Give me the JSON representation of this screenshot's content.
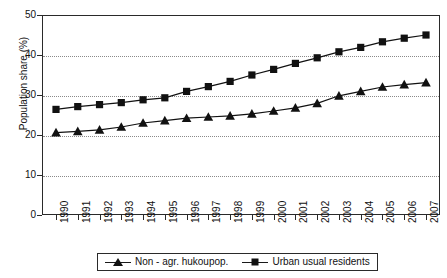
{
  "chart_data": {
    "type": "line",
    "title": "",
    "xlabel": "",
    "ylabel": "Population share (%)",
    "ylim": [
      0,
      50
    ],
    "yticks": [
      0,
      10,
      20,
      30,
      40,
      50
    ],
    "grid": "horizontal-dotted",
    "legend_position": "bottom",
    "categories": [
      "1990",
      "1991",
      "1992",
      "1993",
      "1994",
      "1995",
      "1996",
      "1997",
      "1998",
      "1999",
      "2000",
      "2001",
      "2002",
      "2003",
      "2004",
      "2005",
      "2006",
      "2007"
    ],
    "series": [
      {
        "name": "Non - agr. hukoupop.",
        "marker": "triangle",
        "color": "#111111",
        "values": [
          20.6,
          20.9,
          21.3,
          22.0,
          23.0,
          23.6,
          24.2,
          24.5,
          24.8,
          25.3,
          26.0,
          26.8,
          27.9,
          29.8,
          30.9,
          32.0,
          32.6,
          33.1
        ]
      },
      {
        "name": "Urban usual residents",
        "marker": "square",
        "color": "#111111",
        "values": [
          26.4,
          27.1,
          27.6,
          28.1,
          28.8,
          29.3,
          30.9,
          32.1,
          33.4,
          35.0,
          36.4,
          37.9,
          39.3,
          40.8,
          41.9,
          43.3,
          44.2,
          45.0
        ]
      }
    ]
  },
  "axes": {
    "y_title": "Population share (%)",
    "y_tick_labels": [
      "0",
      "10",
      "20",
      "30",
      "40",
      "50"
    ],
    "x_tick_labels": [
      "1990",
      "1991",
      "1992",
      "1993",
      "1994",
      "1995",
      "1996",
      "1997",
      "1998",
      "1999",
      "2000",
      "2001",
      "2002",
      "2003",
      "2004",
      "2005",
      "2006",
      "2007"
    ]
  },
  "legend": {
    "entries": [
      {
        "label": "Non - agr. hukoupop.",
        "marker": "triangle-marker"
      },
      {
        "label": "Urban usual residents",
        "marker": "square-marker"
      }
    ]
  },
  "colors": {
    "line": "#111111",
    "axis": "#2a2a2a",
    "grid": "#8a8a8a",
    "background": "#ffffff"
  }
}
